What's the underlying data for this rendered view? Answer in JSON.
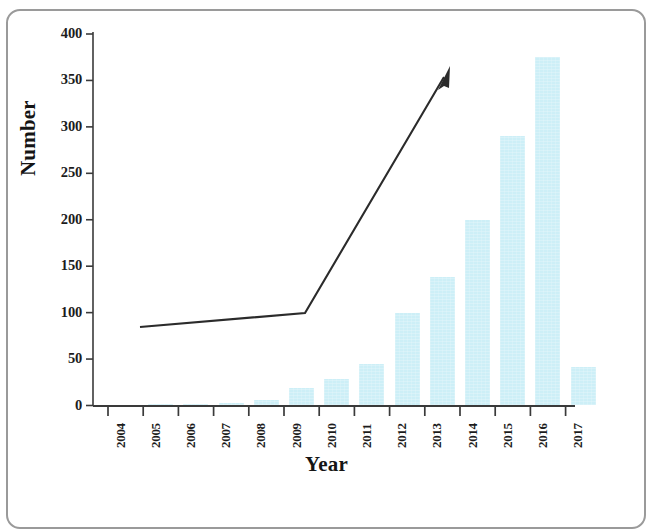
{
  "chart_data": {
    "type": "bar",
    "title": "",
    "xlabel": "Year",
    "ylabel": "Number",
    "categories": [
      "2004",
      "2005",
      "2006",
      "2007",
      "2008",
      "2009",
      "2010",
      "2011",
      "2012",
      "2013",
      "2014",
      "2015",
      "2016",
      "2017"
    ],
    "values": [
      0,
      0.5,
      2,
      3,
      6,
      19,
      28,
      45,
      100,
      138,
      200,
      290,
      375,
      41
    ],
    "ylim": [
      0,
      400
    ],
    "yticks": [
      0,
      50,
      100,
      150,
      200,
      250,
      300,
      350,
      400
    ],
    "ytick_labels": [
      "0",
      "50",
      "100",
      "150",
      "200",
      "250",
      "300",
      "350",
      "400"
    ],
    "grid": false,
    "legend": "none",
    "bar_color": "#cdeff7",
    "annotations": [
      {
        "name": "trend-arrow",
        "type": "arrow-polyline",
        "description": "Black polyline with arrowhead showing slow growth 2005-2009 then steep rise after 2010",
        "points": [
          {
            "x": "2005.0",
            "y": 85
          },
          {
            "x": "2009.7",
            "y": 100
          },
          {
            "x": "2013.9",
            "y": 362
          }
        ]
      }
    ]
  },
  "axes": {
    "y_axis_label": "Number",
    "x_axis_label": "Year"
  },
  "frame": {
    "border_color": "#9a9a9a"
  }
}
